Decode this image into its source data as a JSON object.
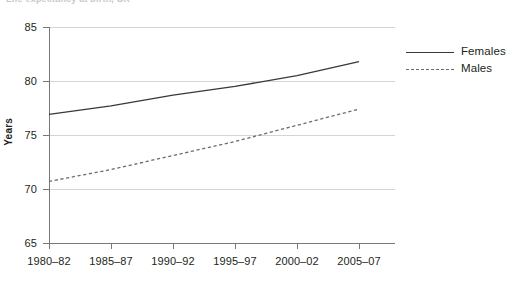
{
  "title_fragment": "Life expectancy at birth, UK",
  "chart_data": {
    "type": "line",
    "title": "",
    "xlabel": "",
    "ylabel": "Years",
    "ylim": [
      65,
      85
    ],
    "yticks": [
      65,
      70,
      75,
      80,
      85
    ],
    "grid": true,
    "legend_position": "right",
    "categories": [
      "1980–82",
      "1985–87",
      "1990–92",
      "1995–97",
      "2000–02",
      "2005–07"
    ],
    "series": [
      {
        "name": "Females",
        "style": "solid",
        "color": "#3b3738",
        "values": [
          76.9,
          77.7,
          78.7,
          79.5,
          80.5,
          81.8
        ]
      },
      {
        "name": "Males",
        "style": "dashed",
        "color": "#6d6a6b",
        "values": [
          70.7,
          71.8,
          73.1,
          74.4,
          75.9,
          77.4
        ]
      }
    ]
  },
  "axis": {
    "y_title": "Years",
    "y_tick_labels": [
      "85",
      "80",
      "75",
      "70",
      "65"
    ],
    "x_tick_labels": [
      "1980–82",
      "1985–87",
      "1990–92",
      "1995–97",
      "2000–02",
      "2005–07"
    ]
  },
  "legend": {
    "items": [
      {
        "label": "Females",
        "style": "solid"
      },
      {
        "label": "Males",
        "style": "dashed"
      }
    ]
  },
  "colors": {
    "females_line": "#3b3738",
    "males_line": "#6d6a6b",
    "gridline": "#d6d4d2",
    "axis": "#7a7778",
    "text": "#231f20",
    "background": "#ffffff"
  }
}
